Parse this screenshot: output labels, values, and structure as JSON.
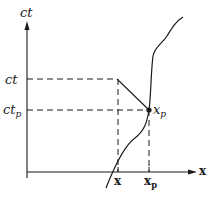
{
  "diagram": {
    "y_axis_label": "ct",
    "x_axis_label": "x",
    "ct_label": "ct",
    "ctp_label_main": "ct",
    "ctp_label_sub": "p",
    "point_label_main": "x",
    "point_label_sub": "p",
    "x_tick_label": "x",
    "xp_tick_label_main": "x",
    "xp_tick_label_sub": "p",
    "colors": {
      "ink": "#1a1a1a",
      "background": "#ffffff"
    }
  }
}
